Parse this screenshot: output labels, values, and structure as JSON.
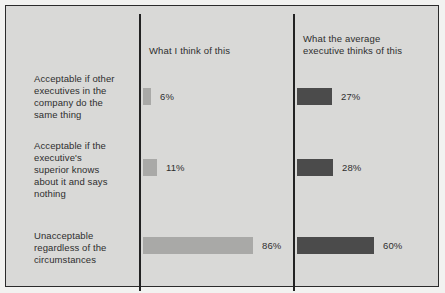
{
  "chart_data": {
    "type": "bar",
    "title": "",
    "subtitle": "",
    "xlabel": "",
    "ylabel": "",
    "orientation": "horizontal",
    "grid": false,
    "legend_position": "column-headers",
    "xlim": [
      0,
      100
    ],
    "value_suffix": "%",
    "categories": [
      "Acceptable if other executives in the company do the same thing",
      "Acceptable if the executive's superior knows about it and says nothing",
      "Unacceptable regardless of the circumstances"
    ],
    "series": [
      {
        "name": "What I think of this",
        "color": "#a9a9a7",
        "values": [
          6,
          11,
          86
        ],
        "labels": [
          "6%",
          "11%",
          "86%"
        ]
      },
      {
        "name": "What the average executive thinks of this",
        "color": "#4b4b4b",
        "values": [
          27,
          28,
          60
        ],
        "labels": [
          "27%",
          "28%",
          "60%"
        ]
      }
    ]
  },
  "columns": [
    {
      "header": "What I think of this"
    },
    {
      "header": "What the average\nexecutive thinks of this"
    }
  ],
  "rows": [
    {
      "label": "Acceptable if other\nexecutives in the\ncompany do the\nsame thing"
    },
    {
      "label": "Acceptable if the\nexecutive's\nsuperior knows\nabout it and says\nnothing"
    },
    {
      "label": "Unacceptable\nregardless of the\ncircumstances"
    }
  ],
  "colors": {
    "panel_background": "#d9d9d7",
    "page_background": "#f2f2f0",
    "frame": "#2b2b2b",
    "divider": "#222222",
    "light_bar": "#a9a9a7",
    "dark_bar": "#4b4b4b",
    "text": "#2e2e2e"
  }
}
